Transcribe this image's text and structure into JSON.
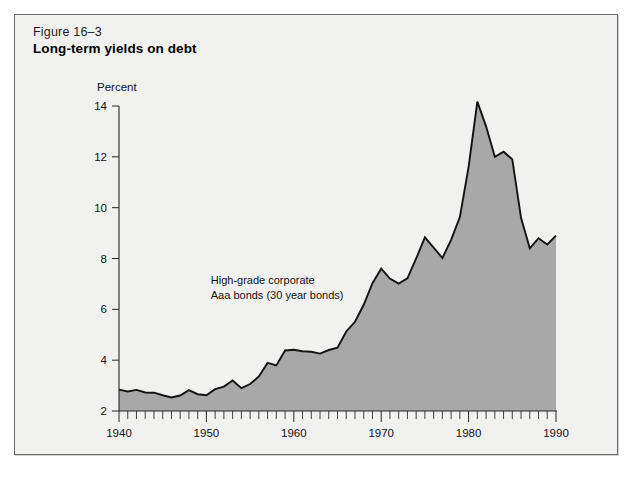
{
  "figure": {
    "number": "Figure 16–3",
    "title": "Long-term yields on debt"
  },
  "chart_data": {
    "type": "area",
    "title": "Long-term yields on debt",
    "subtitle": "Figure 16–3",
    "xlabel": "",
    "ylabel": "Percent",
    "ylim": [
      2,
      14
    ],
    "xlim": [
      1940,
      1990
    ],
    "yticks": [
      2,
      4,
      6,
      8,
      10,
      12,
      14
    ],
    "ytick_labels": [
      "2",
      "4",
      "6",
      "8",
      "10",
      "12",
      "14"
    ],
    "xticks": [
      1940,
      1950,
      1960,
      1970,
      1980,
      1990
    ],
    "xtick_labels": [
      "1940",
      "1950",
      "1960",
      "1970",
      "1980",
      "1990"
    ],
    "minor_xtick_interval": 1,
    "grid": false,
    "legend": "none",
    "annotations": [
      {
        "name": "series-annotation",
        "line1": "High-grade corporate",
        "line2": "Aaa  bonds (30 year bonds)",
        "x": 1950.5,
        "y": 7.0
      }
    ],
    "series": [
      {
        "name": "High-grade corporate Aaa bonds (30 year bonds)",
        "fill_color": "#a8a8a8",
        "line_color": "#131313",
        "x": [
          1940,
          1941,
          1942,
          1943,
          1944,
          1945,
          1946,
          1947,
          1948,
          1949,
          1950,
          1951,
          1952,
          1953,
          1954,
          1955,
          1956,
          1957,
          1958,
          1959,
          1960,
          1961,
          1962,
          1963,
          1964,
          1965,
          1966,
          1967,
          1968,
          1969,
          1970,
          1971,
          1972,
          1973,
          1974,
          1975,
          1976,
          1977,
          1978,
          1979,
          1980,
          1981,
          1982,
          1983,
          1984,
          1985,
          1986,
          1987,
          1988,
          1989,
          1990
        ],
        "values": [
          2.84,
          2.77,
          2.83,
          2.73,
          2.72,
          2.62,
          2.53,
          2.61,
          2.82,
          2.66,
          2.62,
          2.86,
          2.96,
          3.2,
          2.9,
          3.06,
          3.36,
          3.89,
          3.79,
          4.38,
          4.41,
          4.35,
          4.33,
          4.26,
          4.4,
          4.49,
          5.13,
          5.51,
          6.18,
          7.03,
          7.6,
          7.21,
          7.01,
          7.22,
          8.0,
          8.83,
          8.43,
          8.02,
          8.73,
          9.63,
          11.6,
          14.17,
          13.2,
          12.0,
          12.2,
          11.9,
          9.6,
          8.4,
          8.8,
          8.55,
          8.9
        ]
      }
    ]
  }
}
